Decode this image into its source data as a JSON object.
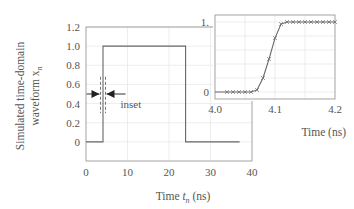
{
  "chart_data": [
    {
      "type": "line",
      "title": "",
      "xlabel": "Time t_n (ns)",
      "xlabel_main": "Time ",
      "xlabel_var": "t",
      "xlabel_sub": "n",
      "xlabel_unit": " (ns)",
      "ylabel_line1": "Simulated time-domain",
      "ylabel_line2": "waveform x",
      "ylabel_sub": "n",
      "xlim": [
        0,
        40
      ],
      "ylim": [
        -0.2,
        1.2
      ],
      "xticks": [
        0,
        10,
        20,
        30,
        40
      ],
      "xtick_labels": [
        "0",
        "10",
        "20",
        "30",
        "40"
      ],
      "yticks": [
        0,
        0.2,
        0.4,
        0.6,
        0.8,
        1.0,
        1.2
      ],
      "ytick_labels": [
        "0",
        "0.2",
        "0.4",
        "0.6",
        "0.8",
        "1.0",
        "1.2"
      ],
      "grid": true,
      "series": [
        {
          "name": "waveform",
          "x": [
            0,
            4.1,
            4.1,
            24,
            24,
            37
          ],
          "y": [
            0,
            0,
            1.0,
            1.0,
            0,
            0
          ]
        }
      ],
      "annotations": [
        {
          "text": "inset",
          "x_range": [
            3.5,
            4.7
          ],
          "arrow_y": 0.5
        }
      ]
    },
    {
      "type": "line",
      "title": "inset",
      "xlabel": "Time (ns)",
      "xlim": [
        4.0,
        4.2
      ],
      "ylim": [
        -0.1,
        1.1
      ],
      "xticks": [
        4.0,
        4.1,
        4.2
      ],
      "xtick_labels": [
        "4.0",
        "4.1",
        "4.2"
      ],
      "yticks": [
        0,
        1
      ],
      "ytick_labels": [
        "0",
        "1."
      ],
      "grid": true,
      "series": [
        {
          "name": "waveform",
          "markers": "x",
          "x": [
            4.0,
            4.02,
            4.03,
            4.04,
            4.05,
            4.06,
            4.07,
            4.08,
            4.09,
            4.1,
            4.11,
            4.12,
            4.13,
            4.14,
            4.15,
            4.16,
            4.17,
            4.18,
            4.19,
            4.2
          ],
          "y": [
            0,
            0,
            0,
            0,
            0,
            0,
            0.03,
            0.2,
            0.47,
            0.77,
            0.97,
            1.0,
            1.0,
            1.0,
            1.0,
            1.0,
            1.0,
            1.0,
            1.0,
            1.0
          ],
          "marker_x": [
            4.02,
            4.03,
            4.04,
            4.05,
            4.06,
            4.07,
            4.08,
            4.09,
            4.1,
            4.11,
            4.12,
            4.13,
            4.14,
            4.15,
            4.16,
            4.17,
            4.18,
            4.19,
            4.2
          ]
        }
      ]
    }
  ]
}
